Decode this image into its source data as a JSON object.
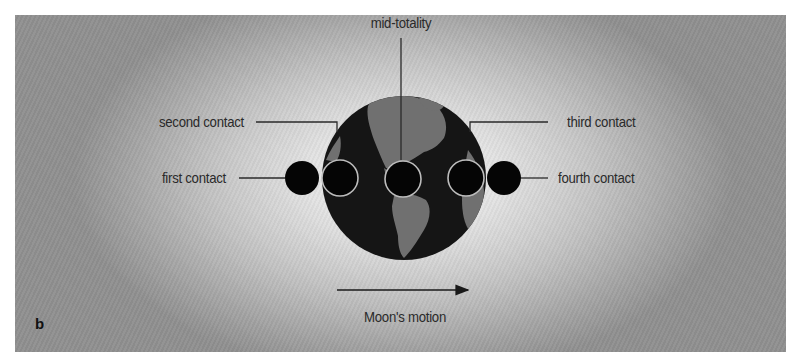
{
  "figure": {
    "panel_label": "b",
    "labels": {
      "mid_totality": "mid-totality",
      "second_contact": "second contact",
      "third_contact": "third contact",
      "first_contact": "first contact",
      "fourth_contact": "fourth contact",
      "motion": "Moon's motion"
    },
    "earth": {
      "cx": 404,
      "cy": 178,
      "r": 82,
      "ocean_color": "#151515",
      "land_color": "#707070"
    },
    "moons": [
      {
        "name": "first-contact",
        "cx": 302,
        "cy": 178,
        "r": 17,
        "outlined": false
      },
      {
        "name": "second-contact",
        "cx": 340,
        "cy": 178,
        "r": 18,
        "outlined": true
      },
      {
        "name": "mid-totality",
        "cx": 403,
        "cy": 179,
        "r": 18,
        "outlined": true
      },
      {
        "name": "third-contact",
        "cx": 466,
        "cy": 178,
        "r": 18,
        "outlined": true
      },
      {
        "name": "fourth-contact",
        "cx": 504,
        "cy": 178,
        "r": 17,
        "outlined": false
      }
    ],
    "colors": {
      "moon_fill": "#050505",
      "moon_outline": "#bdbdbd",
      "line": "#2a2a2a",
      "text": "#2a2a2a"
    },
    "arrow": {
      "x1": 337,
      "x2": 468,
      "y": 290,
      "direction": "right"
    }
  }
}
